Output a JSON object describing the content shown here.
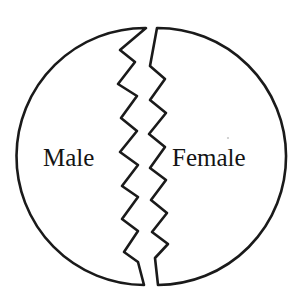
{
  "figure": {
    "background_color": "#ffffff",
    "stroke_color": "#1a1a1a",
    "canvas": {
      "width": 301,
      "height": 307
    },
    "circle": {
      "center_x": 150,
      "center_y": 156,
      "radius": 128
    },
    "labels": {
      "left": "Male",
      "right": "Female"
    },
    "left_label_position": {
      "x": 43,
      "y": 166
    },
    "right_label_position": {
      "x": 172,
      "y": 166
    },
    "shapes": {
      "left_half_path": "M 146 28 A 128 128 0 1 0 144 285 L 138 262 L 124 252 L 138 231 L 122 219 L 138 197 L 122 186 L 138 165 L 120 152 L 137 131 L 121 118 L 137 96 L 118 84 L 135 62 L 120 50 L 146 28 Z",
      "right_half_path": "M 157 28 A 128 128 0 1 1 158 285 L 155 258 L 168 244 L 152 232 L 167 213 L 151 200 L 166 180 L 150 168 L 165 147 L 149 134 L 166 113 L 150 100 L 165 79 L 150 66 L 157 28 Z"
    },
    "speck": {
      "x": 228,
      "y": 138,
      "r": 1.1
    }
  }
}
